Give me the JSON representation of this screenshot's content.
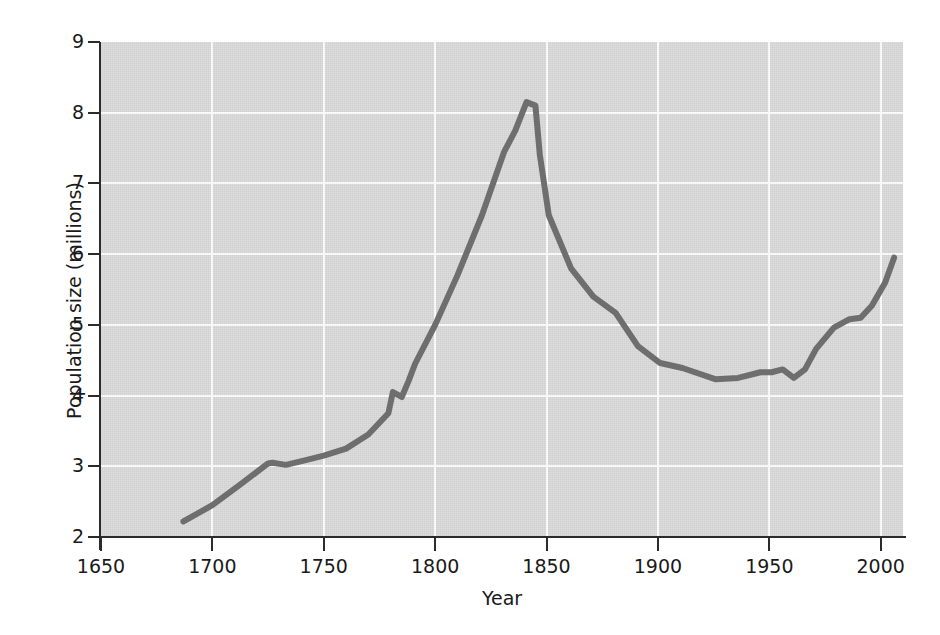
{
  "chart_data": {
    "type": "line",
    "title": "",
    "xlabel": "Year",
    "ylabel": "Population size (millions)",
    "xlim": [
      1650,
      2010
    ],
    "ylim": [
      2,
      9
    ],
    "grid": true,
    "legend": "none",
    "xticks": [
      1650,
      1700,
      1750,
      1800,
      1850,
      1900,
      1950,
      2000
    ],
    "xtick_labels": [
      "1650",
      "1700",
      "1750",
      "1800",
      "1850",
      "1900",
      "1950",
      "2000"
    ],
    "yticks": [
      2,
      3,
      4,
      5,
      6,
      7,
      8,
      9
    ],
    "ytick_labels": [
      "2",
      "3",
      "4",
      "5",
      "6",
      "7",
      "8",
      "9"
    ],
    "series": [
      {
        "name": "Population size (millions)",
        "color": "#6e6e6e",
        "line_width": 6,
        "x": [
          1687,
          1700,
          1712,
          1725,
          1727,
          1733,
          1741,
          1750,
          1760,
          1770,
          1779,
          1781,
          1785,
          1788,
          1791,
          1800,
          1810,
          1821,
          1831,
          1836,
          1841,
          1845,
          1847,
          1851,
          1861,
          1871,
          1881,
          1891,
          1901,
          1911,
          1926,
          1936,
          1946,
          1951,
          1956,
          1961,
          1966,
          1971,
          1979,
          1986,
          1991,
          1996,
          2002,
          2006
        ],
        "y": [
          2.22,
          2.45,
          2.73,
          3.04,
          3.05,
          3.02,
          3.08,
          3.15,
          3.25,
          3.45,
          3.75,
          4.05,
          3.98,
          4.2,
          4.45,
          5.0,
          5.7,
          6.55,
          7.45,
          7.75,
          8.15,
          8.1,
          7.4,
          6.55,
          5.8,
          5.4,
          5.17,
          4.7,
          4.46,
          4.39,
          4.23,
          4.25,
          4.33,
          4.33,
          4.37,
          4.25,
          4.37,
          4.66,
          4.96,
          5.08,
          5.1,
          5.27,
          5.6,
          5.95
        ]
      }
    ]
  },
  "axes": {
    "y_axis_label": "Population size (millions)",
    "x_axis_label": "Year"
  },
  "style": {
    "plot_background": "#d9d9d9",
    "gridline_color": "#fdfdfd",
    "axis_color": "#2b2b2b",
    "line_color": "#6e6e6e",
    "page_background": "#ffffff"
  }
}
